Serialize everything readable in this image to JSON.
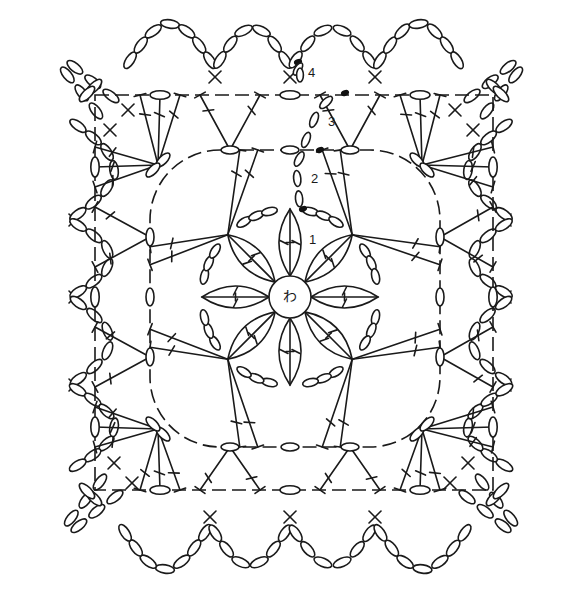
{
  "diagram": {
    "type": "crochet-chart",
    "center_ring_label": "わ",
    "round_labels": [
      {
        "label": "1",
        "x": 309,
        "y": 233
      },
      {
        "label": "2",
        "x": 311,
        "y": 172
      },
      {
        "label": "3",
        "x": 328,
        "y": 115
      },
      {
        "label": "4",
        "x": 308,
        "y": 66
      }
    ],
    "colors": {
      "line": "#1a1a1a",
      "background": "#ffffff"
    },
    "symbols": {
      "chain": "oval",
      "slip-stitch": "filled-dot",
      "single-crochet": "x",
      "double-crochet": "T-with-crossbar",
      "magic-ring": "circle"
    },
    "rounds": [
      {
        "number": 1,
        "description": "8 petals of clustered stitches from magic ring, joined by chains"
      },
      {
        "number": 2,
        "description": "rounded square with fans of double crochet at 8 points"
      },
      {
        "number": 3,
        "description": "square with 3-stitch fans and chain corners"
      },
      {
        "number": 4,
        "description": "scalloped chain loops around edge with corner loops"
      }
    ]
  }
}
